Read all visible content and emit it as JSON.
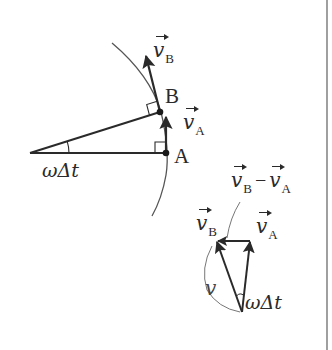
{
  "figure": {
    "colors": {
      "stroke": "#2a2a2a",
      "arc": "#555555",
      "guide": "#777777",
      "border": "#888888",
      "background": "#ffffff"
    },
    "top_diagram": {
      "point_A": "A",
      "point_B": "B",
      "vector_vB": {
        "symbol": "v",
        "subscript": "B"
      },
      "vector_vA": {
        "symbol": "v",
        "subscript": "A"
      },
      "angle_label": "ωΔt"
    },
    "bottom_diagram": {
      "difference_label": {
        "first": {
          "symbol": "v",
          "subscript": "B"
        },
        "operator": "−",
        "second": {
          "symbol": "v",
          "subscript": "A"
        }
      },
      "vector_vB": {
        "symbol": "v",
        "subscript": "B"
      },
      "vector_vA": {
        "symbol": "v",
        "subscript": "A"
      },
      "magnitude_label": "v",
      "angle_label": "ωΔt"
    }
  }
}
